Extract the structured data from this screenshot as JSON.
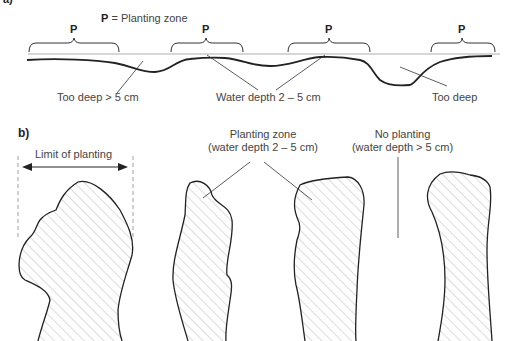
{
  "panel_a": {
    "label": "a)",
    "legend_key": "P",
    "legend_text": " = Planting zone",
    "zone_marker": "P",
    "annotations": {
      "too_deep_5cm": "Too deep > 5 cm",
      "water_depth": "Water depth 2 – 5 cm",
      "too_deep": "Too deep"
    }
  },
  "panel_b": {
    "label": "b)",
    "limit_label": "Limit of planting",
    "planting_zone_title": "Planting zone",
    "planting_zone_sub": "(water depth 2 – 5 cm)",
    "no_planting_title": "No planting",
    "no_planting_sub": "(water depth > 5 cm)"
  },
  "colors": {
    "line": "#222222",
    "hatch": "#9a9a9a",
    "dash": "#888888",
    "text": "#444444"
  }
}
